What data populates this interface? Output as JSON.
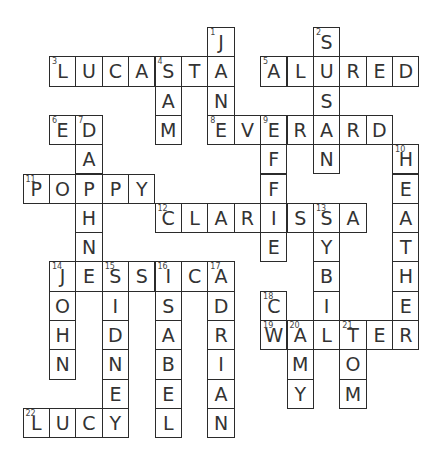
{
  "puzzle": {
    "type": "crossword",
    "grid": {
      "cols": 15,
      "rows": 14,
      "origin_x": 22.5,
      "origin_y": 27,
      "cell_w": 26.4,
      "cell_h": 29.3
    },
    "cells": [
      {
        "r": 0,
        "c": 7,
        "ch": "J",
        "n": "1"
      },
      {
        "r": 1,
        "c": 7,
        "ch": "A"
      },
      {
        "r": 2,
        "c": 7,
        "ch": "N"
      },
      {
        "r": 3,
        "c": 7,
        "ch": "E",
        "n": "8"
      },
      {
        "r": 0,
        "c": 11,
        "ch": "S",
        "n": "2"
      },
      {
        "r": 1,
        "c": 11,
        "ch": "U"
      },
      {
        "r": 2,
        "c": 11,
        "ch": "S"
      },
      {
        "r": 3,
        "c": 11,
        "ch": "A"
      },
      {
        "r": 4,
        "c": 11,
        "ch": "N"
      },
      {
        "r": 1,
        "c": 1,
        "ch": "L",
        "n": "3"
      },
      {
        "r": 1,
        "c": 2,
        "ch": "U"
      },
      {
        "r": 1,
        "c": 3,
        "ch": "C"
      },
      {
        "r": 1,
        "c": 4,
        "ch": "A"
      },
      {
        "r": 1,
        "c": 5,
        "ch": "S",
        "n": "4"
      },
      {
        "r": 1,
        "c": 6,
        "ch": "T"
      },
      {
        "r": 2,
        "c": 5,
        "ch": "A"
      },
      {
        "r": 3,
        "c": 5,
        "ch": "M"
      },
      {
        "r": 1,
        "c": 9,
        "ch": "A",
        "n": "5"
      },
      {
        "r": 1,
        "c": 10,
        "ch": "L"
      },
      {
        "r": 1,
        "c": 12,
        "ch": "R"
      },
      {
        "r": 1,
        "c": 13,
        "ch": "E"
      },
      {
        "r": 1,
        "c": 14,
        "ch": "D"
      },
      {
        "r": 3,
        "c": 1,
        "ch": "E",
        "n": "6"
      },
      {
        "r": 3,
        "c": 2,
        "ch": "D",
        "n": "7"
      },
      {
        "r": 4,
        "c": 2,
        "ch": "A"
      },
      {
        "r": 5,
        "c": 2,
        "ch": "P"
      },
      {
        "r": 6,
        "c": 2,
        "ch": "H"
      },
      {
        "r": 7,
        "c": 2,
        "ch": "N"
      },
      {
        "r": 3,
        "c": 8,
        "ch": "V"
      },
      {
        "r": 3,
        "c": 9,
        "ch": "E",
        "n": "9"
      },
      {
        "r": 3,
        "c": 10,
        "ch": "R"
      },
      {
        "r": 3,
        "c": 12,
        "ch": "R"
      },
      {
        "r": 3,
        "c": 13,
        "ch": "D"
      },
      {
        "r": 4,
        "c": 9,
        "ch": "F"
      },
      {
        "r": 5,
        "c": 9,
        "ch": "F"
      },
      {
        "r": 6,
        "c": 9,
        "ch": "I"
      },
      {
        "r": 7,
        "c": 9,
        "ch": "E"
      },
      {
        "r": 4,
        "c": 14,
        "ch": "H",
        "n": "10"
      },
      {
        "r": 5,
        "c": 14,
        "ch": "E"
      },
      {
        "r": 6,
        "c": 14,
        "ch": "A"
      },
      {
        "r": 7,
        "c": 14,
        "ch": "T"
      },
      {
        "r": 8,
        "c": 14,
        "ch": "H"
      },
      {
        "r": 9,
        "c": 14,
        "ch": "E"
      },
      {
        "r": 10,
        "c": 14,
        "ch": "R"
      },
      {
        "r": 5,
        "c": 0,
        "ch": "P",
        "n": "11"
      },
      {
        "r": 5,
        "c": 1,
        "ch": "O"
      },
      {
        "r": 5,
        "c": 3,
        "ch": "P"
      },
      {
        "r": 5,
        "c": 4,
        "ch": "Y"
      },
      {
        "r": 6,
        "c": 5,
        "ch": "C",
        "n": "12"
      },
      {
        "r": 6,
        "c": 6,
        "ch": "L"
      },
      {
        "r": 6,
        "c": 7,
        "ch": "A"
      },
      {
        "r": 6,
        "c": 8,
        "ch": "R"
      },
      {
        "r": 6,
        "c": 10,
        "ch": "S"
      },
      {
        "r": 6,
        "c": 11,
        "ch": "S",
        "n": "13"
      },
      {
        "r": 6,
        "c": 12,
        "ch": "A"
      },
      {
        "r": 7,
        "c": 11,
        "ch": "Y"
      },
      {
        "r": 8,
        "c": 11,
        "ch": "B"
      },
      {
        "r": 9,
        "c": 11,
        "ch": "I"
      },
      {
        "r": 10,
        "c": 11,
        "ch": "L"
      },
      {
        "r": 8,
        "c": 1,
        "ch": "J",
        "n": "14"
      },
      {
        "r": 8,
        "c": 2,
        "ch": "E"
      },
      {
        "r": 8,
        "c": 3,
        "ch": "S",
        "n": "15"
      },
      {
        "r": 8,
        "c": 4,
        "ch": "S"
      },
      {
        "r": 8,
        "c": 5,
        "ch": "I",
        "n": "16"
      },
      {
        "r": 8,
        "c": 6,
        "ch": "C"
      },
      {
        "r": 8,
        "c": 7,
        "ch": "A",
        "n": "17"
      },
      {
        "r": 9,
        "c": 1,
        "ch": "O"
      },
      {
        "r": 10,
        "c": 1,
        "ch": "H"
      },
      {
        "r": 11,
        "c": 1,
        "ch": "N"
      },
      {
        "r": 9,
        "c": 3,
        "ch": "I"
      },
      {
        "r": 10,
        "c": 3,
        "ch": "D"
      },
      {
        "r": 11,
        "c": 3,
        "ch": "N"
      },
      {
        "r": 12,
        "c": 3,
        "ch": "E"
      },
      {
        "r": 13,
        "c": 3,
        "ch": "Y"
      },
      {
        "r": 9,
        "c": 5,
        "ch": "S"
      },
      {
        "r": 10,
        "c": 5,
        "ch": "A"
      },
      {
        "r": 11,
        "c": 5,
        "ch": "B"
      },
      {
        "r": 12,
        "c": 5,
        "ch": "E"
      },
      {
        "r": 13,
        "c": 5,
        "ch": "L"
      },
      {
        "r": 9,
        "c": 7,
        "ch": "D"
      },
      {
        "r": 10,
        "c": 7,
        "ch": "R"
      },
      {
        "r": 11,
        "c": 7,
        "ch": "I"
      },
      {
        "r": 12,
        "c": 7,
        "ch": "A"
      },
      {
        "r": 13,
        "c": 7,
        "ch": "N"
      },
      {
        "r": 9,
        "c": 9,
        "ch": "C",
        "n": "18"
      },
      {
        "r": 10,
        "c": 9,
        "ch": "W",
        "n": "19"
      },
      {
        "r": 10,
        "c": 10,
        "ch": "A",
        "n": "20"
      },
      {
        "r": 10,
        "c": 12,
        "ch": "T",
        "n": "21"
      },
      {
        "r": 10,
        "c": 13,
        "ch": "E"
      },
      {
        "r": 11,
        "c": 10,
        "ch": "M"
      },
      {
        "r": 12,
        "c": 10,
        "ch": "Y"
      },
      {
        "r": 11,
        "c": 12,
        "ch": "O"
      },
      {
        "r": 12,
        "c": 12,
        "ch": "M"
      },
      {
        "r": 13,
        "c": 0,
        "ch": "L",
        "n": "22"
      },
      {
        "r": 13,
        "c": 1,
        "ch": "U"
      },
      {
        "r": 13,
        "c": 2,
        "ch": "C"
      }
    ],
    "words": {
      "across": [
        "3 LUCASTA",
        "5 ALURED",
        "6 ED",
        "8 EVERARD",
        "11 POPPY",
        "12 CLARISSA",
        "14 JESSICA",
        "19 WALTER",
        "22 LUCY"
      ],
      "down": [
        "1 JANE",
        "2 SUSAN",
        "4 SAM",
        "7 DAPHNE",
        "9 EFFIE",
        "10 HEATHER",
        "13 SYBIL",
        "14 JOHN",
        "15 SIDNEY",
        "16 ISABEL",
        "17 ADRIAN",
        "18 C",
        "20 AMY",
        "21 TOM"
      ]
    }
  }
}
